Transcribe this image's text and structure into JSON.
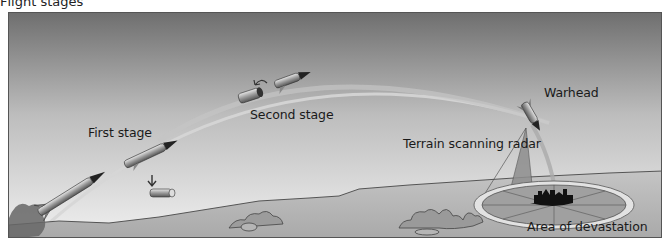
{
  "figure": {
    "title": "Flight stages",
    "labels": {
      "first_stage": "First stage",
      "second_stage": "Second stage",
      "warhead": "Warhead",
      "radar": "Terrain scanning radar",
      "devastation": "Area of devastation"
    },
    "colors": {
      "sky_top": "#7a7a7a",
      "sky_bottom": "#eeeeee",
      "ground": "#b8b8b8",
      "ground_line": "#555555",
      "trail": "#c9c9c9",
      "missile_body": "#9a9a9a",
      "missile_nose": "#222222",
      "radar_cone": "#8e8e8e",
      "devastation_ring": "#e4e4e4",
      "target": "#111111"
    }
  }
}
